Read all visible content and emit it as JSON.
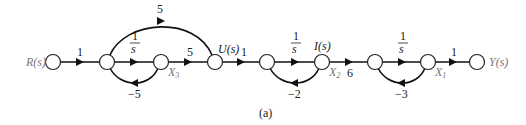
{
  "diagram": {
    "type": "signal-flow-graph",
    "caption": "(a)",
    "nodes": [
      {
        "id": "R",
        "label": "R(s)",
        "x": 53,
        "y": 62
      },
      {
        "id": "n2",
        "label": "",
        "x": 107,
        "y": 62
      },
      {
        "id": "X3",
        "label": "X",
        "sub": "3",
        "x": 161,
        "y": 62
      },
      {
        "id": "U",
        "label": "U(s)",
        "x": 215,
        "y": 62
      },
      {
        "id": "n5",
        "label": "",
        "x": 267,
        "y": 62
      },
      {
        "id": "X2",
        "label": "X",
        "sub": "2",
        "top": "I(s)",
        "x": 322,
        "y": 62
      },
      {
        "id": "n7",
        "label": "",
        "x": 375,
        "y": 62
      },
      {
        "id": "X1",
        "label": "X",
        "sub": "1",
        "x": 428,
        "y": 62
      },
      {
        "id": "Y",
        "label": "Y(s)",
        "x": 477,
        "y": 62
      }
    ],
    "branches": [
      {
        "from": "R",
        "to": "n2",
        "gain": "1"
      },
      {
        "from": "n2",
        "to": "X3",
        "gain": "1/s"
      },
      {
        "from": "X3",
        "to": "n2",
        "gain": "−5"
      },
      {
        "from": "n2",
        "to": "U",
        "gain": "5"
      },
      {
        "from": "X3",
        "to": "U",
        "gain": "5"
      },
      {
        "from": "U",
        "to": "n5",
        "gain": "1"
      },
      {
        "from": "n5",
        "to": "X2",
        "gain": "1/s"
      },
      {
        "from": "X2",
        "to": "n5",
        "gain": "−2"
      },
      {
        "from": "X2",
        "to": "n7",
        "gain": "6"
      },
      {
        "from": "n7",
        "to": "X1",
        "gain": "1/s"
      },
      {
        "from": "X1",
        "to": "n7",
        "gain": "−3"
      },
      {
        "from": "X1",
        "to": "Y",
        "gain": "1"
      }
    ],
    "labels": {
      "r": "R(s)",
      "y": "Y(s)",
      "u": "U(s)",
      "i": "I(s)",
      "x": "X",
      "sub1": "1",
      "sub2": "2",
      "sub3": "3",
      "one": "1",
      "s": "s",
      "g_r_n2": "1",
      "g_ff": "5",
      "g_x3_u": "5",
      "g_fb3": "−5",
      "g_u_n5": "1",
      "g_fb2": "−2",
      "g_x2_n7": "6",
      "g_fb1": "−3",
      "g_x1_y": "1"
    }
  }
}
